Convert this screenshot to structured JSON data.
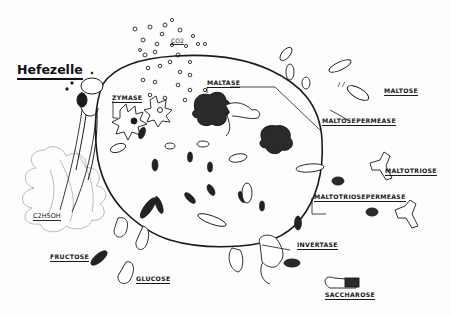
{
  "diagram": {
    "title": "Hefezelle",
    "gas_label": "CO2",
    "ethanol_label": "C2H5OH",
    "labels": {
      "zymase": "ZYMASE",
      "maltase": "MALTASE",
      "maltose": "MALTOSE",
      "maltosepermease": "MALTOSEPERMEASE",
      "maltotriose": "MALTOTRIOSE",
      "maltotriosepermease": "MALTOTRIOSEPERMEASE",
      "invertase": "INVERTASE",
      "saccharose": "SACCHAROSE",
      "fructose": "FRUCTOSE",
      "glucose": "GLUCOSE"
    },
    "colors": {
      "ink": "#1a1a1a",
      "paper": "#fdfdfd",
      "faint": "#9a9a9a"
    }
  }
}
